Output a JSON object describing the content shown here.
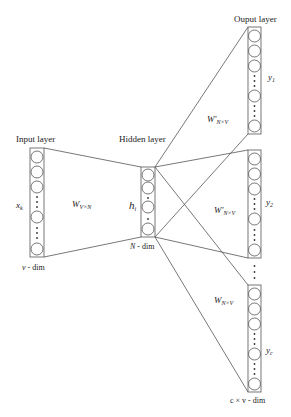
{
  "diagram": {
    "type": "neural-network-architecture",
    "colors": {
      "stroke": "#555555",
      "background": "#ffffff",
      "text": "#222222"
    },
    "layers": {
      "input": {
        "title": "Input layer",
        "variable": "x",
        "variable_sub": "k",
        "dim_label": "v - dim"
      },
      "hidden": {
        "title": "Hidden layer",
        "variable": "h",
        "variable_sub": "i",
        "dim_label": "N - dim"
      },
      "output": {
        "title": "Ouput layer",
        "blocks": [
          {
            "variable": "y",
            "variable_sub": "1"
          },
          {
            "variable": "y",
            "variable_sub": "2"
          },
          {
            "variable": "y",
            "variable_sub": "c"
          }
        ],
        "dim_label": "c × v - dim"
      }
    },
    "weights": {
      "input_hidden": {
        "symbol": "W",
        "sub": "V×N"
      },
      "hidden_output": [
        {
          "symbol": "W'",
          "sub": "N×V"
        },
        {
          "symbol": "W'",
          "sub": "N×V"
        },
        {
          "symbol": "W",
          "sub": "N×V"
        }
      ]
    }
  }
}
